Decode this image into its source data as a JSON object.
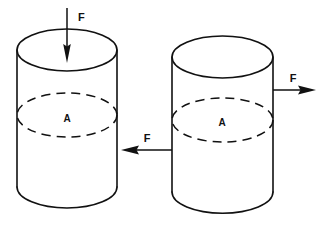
{
  "figure": {
    "background_color": "#ffffff",
    "line_color": "#111111"
  },
  "cylinders": [
    {
      "id": "left-cylinder",
      "name": "compression-cylinder",
      "area_label": "A",
      "top_ellipse": {
        "cx": 67,
        "cy": 50,
        "rx": 50,
        "ry": 21
      },
      "cross_section_ellipse": {
        "cx": 67,
        "cy": 115,
        "rx": 50,
        "ry": 22
      },
      "body": {
        "left": 17,
        "right": 117,
        "top": 50,
        "bottom": 187,
        "bottom_ry": 21
      },
      "area_label_pos": {
        "x": 67,
        "y": 122
      }
    },
    {
      "id": "right-cylinder",
      "name": "shear-cylinder",
      "area_label": "A",
      "top_ellipse": {
        "cx": 222,
        "cy": 57,
        "rx": 50,
        "ry": 21
      },
      "cross_section_ellipse": {
        "cx": 222,
        "cy": 120,
        "rx": 50,
        "ry": 22
      },
      "body": {
        "left": 172,
        "right": 273,
        "top": 57,
        "bottom": 192,
        "bottom_ry": 21
      },
      "area_label_pos": {
        "x": 222,
        "y": 126
      }
    }
  ],
  "arrows": [
    {
      "id": "arrow-down",
      "name": "compression-force-arrow",
      "label": "F",
      "direction": "down",
      "from": {
        "x": 67,
        "y": 8
      },
      "to": {
        "x": 67,
        "y": 63
      },
      "label_pos": {
        "x": 78,
        "y": 21
      }
    },
    {
      "id": "arrow-right",
      "name": "shear-force-arrow-right",
      "label": "F",
      "direction": "right",
      "from": {
        "x": 273,
        "y": 90
      },
      "to": {
        "x": 316,
        "y": 90
      },
      "label_pos": {
        "x": 293,
        "y": 82
      }
    },
    {
      "id": "arrow-left",
      "name": "shear-force-arrow-left",
      "label": "F",
      "direction": "left",
      "from": {
        "x": 172,
        "y": 150
      },
      "to": {
        "x": 121,
        "y": 150
      },
      "label_pos": {
        "x": 147,
        "y": 142
      }
    }
  ]
}
